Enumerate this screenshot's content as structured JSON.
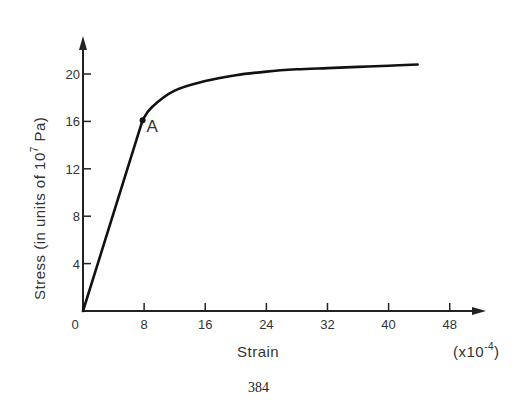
{
  "chart_data": {
    "type": "line",
    "title": "",
    "xlabel": "Strain",
    "xlabel_multiplier": "(x10-4)",
    "ylabel": "Stress (in units of 10^7 Pa)",
    "x_ticks": [
      "0",
      "8",
      "16",
      "24",
      "32",
      "40",
      "48"
    ],
    "y_ticks": [
      "4",
      "8",
      "12",
      "16",
      "20"
    ],
    "xlim": [
      0,
      52
    ],
    "ylim": [
      0,
      23
    ],
    "grid": false,
    "series": [
      {
        "name": "stress-strain curve",
        "x": [
          0,
          7.8,
          9,
          12,
          16,
          20,
          24,
          28,
          32,
          36,
          40,
          43.8
        ],
        "y": [
          0,
          16.1,
          17.2,
          18.6,
          19.4,
          19.9,
          20.2,
          20.4,
          20.5,
          20.6,
          20.7,
          20.8
        ]
      }
    ],
    "annotations": [
      {
        "label": "A",
        "x": 7.8,
        "y": 16.1,
        "note": "proportional limit point"
      }
    ]
  },
  "labels": {
    "point_a": "A",
    "origin": "0",
    "x_axis_title": "Strain",
    "x_multiplier_prefix": "(x10",
    "x_multiplier_exp": "-4",
    "x_multiplier_suffix": ")",
    "y_axis_title_prefix": "Stress (in units of 10",
    "y_axis_title_exp": "7",
    "y_axis_title_suffix": " Pa)",
    "page_number": "384"
  }
}
